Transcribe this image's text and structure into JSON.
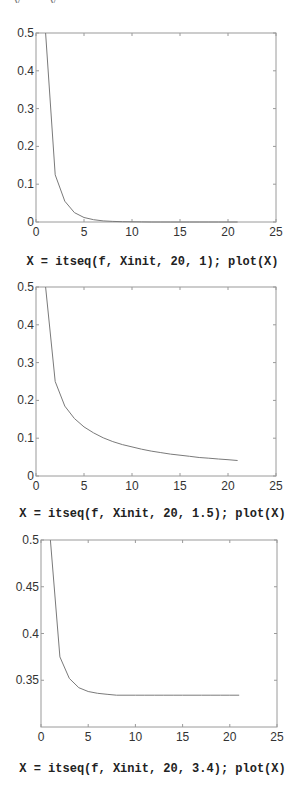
{
  "header_fragment": "y . . . . y",
  "captions": [
    "X = itseq(f, Xinit, 20, 1); plot(X)",
    "X = itseq(f, Xinit, 20, 1.5); plot(X)",
    "X = itseq(f, Xinit, 20, 3.4); plot(X)"
  ],
  "colors": {
    "frame": "#9a9a9a",
    "line": "#7a7a7a",
    "text": "#333333"
  },
  "chart_data": [
    {
      "type": "line",
      "title": "",
      "caption": "X = itseq(f, Xinit, 20, 1); plot(X)",
      "xlabel": "",
      "ylabel": "",
      "xlim": [
        0,
        25
      ],
      "ylim": [
        0,
        0.5
      ],
      "xticks": [
        0,
        5,
        10,
        15,
        20,
        25
      ],
      "yticks": [
        0,
        0.1,
        0.2,
        0.3,
        0.4,
        0.5
      ],
      "ytick_labels": [
        "0",
        "0.1",
        "0.2",
        "0.3",
        "0.4",
        "0.5"
      ],
      "grid": false,
      "x": [
        1,
        2,
        3,
        4,
        5,
        6,
        7,
        8,
        9,
        10,
        11,
        12,
        13,
        14,
        15,
        16,
        17,
        18,
        19,
        20,
        21
      ],
      "series": [
        {
          "name": "X",
          "values": [
            0.5,
            0.125,
            0.055,
            0.025,
            0.012,
            0.006,
            0.003,
            0.0015,
            0.0008,
            0.0004,
            0.0002,
            0.0001,
            0.0001,
            0,
            0,
            0,
            0,
            0,
            0,
            0,
            0
          ]
        }
      ]
    },
    {
      "type": "line",
      "title": "",
      "caption": "X = itseq(f, Xinit, 20, 1.5); plot(X)",
      "xlabel": "",
      "ylabel": "",
      "xlim": [
        0,
        25
      ],
      "ylim": [
        0,
        0.5
      ],
      "xticks": [
        0,
        5,
        10,
        15,
        20,
        25
      ],
      "yticks": [
        0,
        0.1,
        0.2,
        0.3,
        0.4,
        0.5
      ],
      "ytick_labels": [
        "0",
        "0.1",
        "0.2",
        "0.3",
        "0.4",
        "0.5"
      ],
      "grid": false,
      "x": [
        1,
        2,
        3,
        4,
        5,
        6,
        7,
        8,
        9,
        10,
        11,
        12,
        13,
        14,
        15,
        16,
        17,
        18,
        19,
        20,
        21
      ],
      "series": [
        {
          "name": "X",
          "values": [
            0.5,
            0.25,
            0.185,
            0.152,
            0.13,
            0.114,
            0.101,
            0.091,
            0.083,
            0.077,
            0.071,
            0.066,
            0.062,
            0.058,
            0.055,
            0.052,
            0.049,
            0.047,
            0.045,
            0.043,
            0.041
          ]
        }
      ]
    },
    {
      "type": "line",
      "title": "",
      "caption": "X = itseq(f, Xinit, 20, 3.4); plot(X)",
      "xlabel": "",
      "ylabel": "",
      "xlim": [
        0,
        25
      ],
      "ylim": [
        0.3,
        0.5
      ],
      "xticks": [
        0,
        5,
        10,
        15,
        20,
        25
      ],
      "yticks": [
        0.35,
        0.4,
        0.45,
        0.5
      ],
      "ytick_labels": [
        "0.35",
        "0.4",
        "0.45",
        "0.5"
      ],
      "grid": false,
      "x": [
        1,
        2,
        3,
        4,
        5,
        6,
        7,
        8,
        9,
        10,
        11,
        12,
        13,
        14,
        15,
        16,
        17,
        18,
        19,
        20,
        21
      ],
      "series": [
        {
          "name": "X",
          "values": [
            0.5,
            0.375,
            0.352,
            0.342,
            0.338,
            0.336,
            0.335,
            0.334,
            0.334,
            0.334,
            0.334,
            0.334,
            0.334,
            0.334,
            0.334,
            0.334,
            0.334,
            0.334,
            0.334,
            0.334,
            0.334
          ]
        }
      ]
    }
  ],
  "layout": [
    {
      "left": 36,
      "top": 33,
      "right": 276,
      "bottom": 222,
      "caption_top": 255
    },
    {
      "left": 36,
      "top": 287,
      "right": 276,
      "bottom": 476,
      "caption_top": 507
    },
    {
      "left": 41,
      "top": 540,
      "right": 277,
      "bottom": 727,
      "caption_top": 762
    }
  ]
}
